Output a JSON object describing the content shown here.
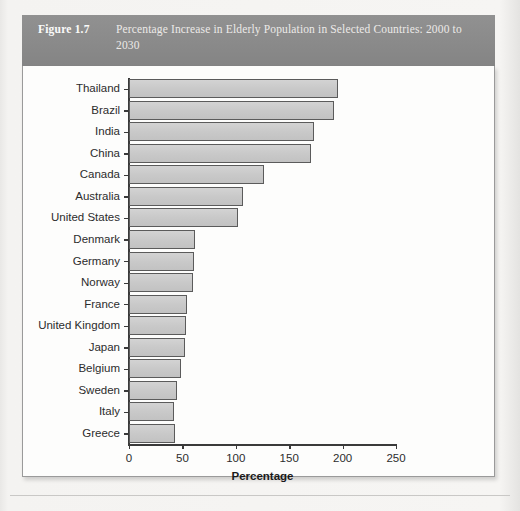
{
  "figure": {
    "number": "Figure 1.7",
    "title": "Percentage Increase in Elderly Population in Selected Countries: 2000 to 2030"
  },
  "chart_data": {
    "type": "bar",
    "orientation": "horizontal",
    "title": "Percentage Increase in Elderly Population in Selected Countries: 2000 to 2030",
    "xlabel": "Percentage",
    "ylabel": "",
    "xlim": [
      0,
      250
    ],
    "xticks": [
      0,
      50,
      100,
      150,
      200,
      250
    ],
    "grid": false,
    "legend": false,
    "categories": [
      "Thailand",
      "Brazil",
      "India",
      "China",
      "Canada",
      "Australia",
      "United States",
      "Denmark",
      "Germany",
      "Norway",
      "France",
      "United Kingdom",
      "Japan",
      "Belgium",
      "Sweden",
      "Italy",
      "Greece"
    ],
    "values": [
      196,
      192,
      173,
      170,
      126,
      107,
      102,
      62,
      61,
      60,
      54,
      53,
      52,
      49,
      45,
      42,
      43
    ],
    "bar_color": "#cdcdcd",
    "bar_edge_color": "#5b5b5b"
  },
  "colors": {
    "caption_bar": "#8e8e8e",
    "caption_text": "#f0efee",
    "panel_bg": "#fdfdfc",
    "axis": "#3a3a3a"
  }
}
